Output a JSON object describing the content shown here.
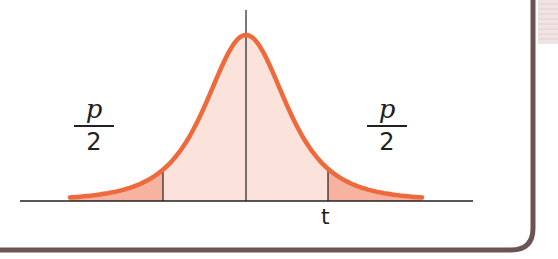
{
  "diagram": {
    "type": "t-distribution two-tailed diagram",
    "left_tail_label": {
      "numerator": "p",
      "denominator": "2"
    },
    "right_tail_label": {
      "numerator": "p",
      "denominator": "2"
    },
    "critical_value_label": "t"
  },
  "colors": {
    "curve": "#ee6a3c",
    "tail_fill": "#f6b3a0",
    "center_fill": "#fbe3dc",
    "axis": "#231f20",
    "frame": "#6b5452",
    "corner_hatch": "#eadcdc"
  }
}
